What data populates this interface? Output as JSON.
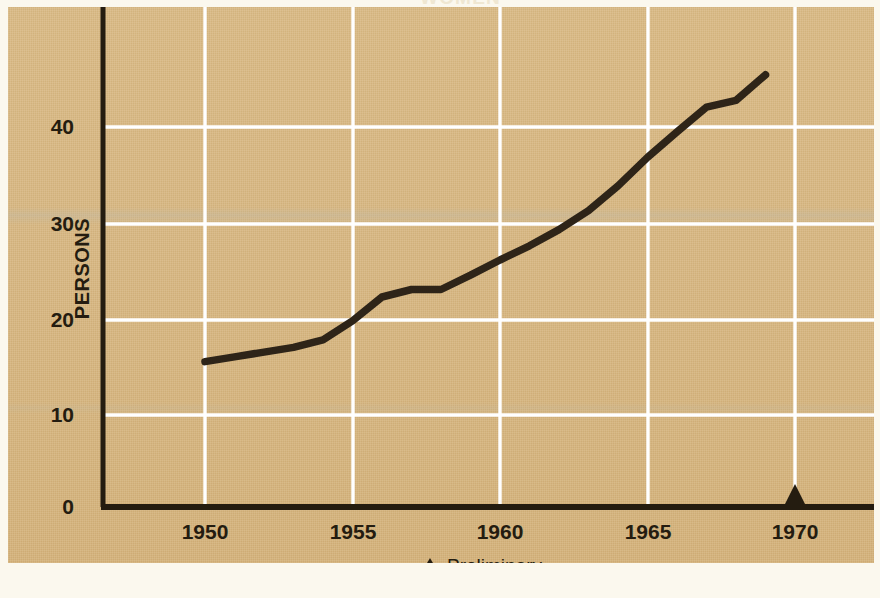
{
  "title": {
    "text": "WOMEN",
    "note": "title is cropped off the top edge; only the bottom sliver of the letters is visible"
  },
  "axes": {
    "y_label": "PERSONS",
    "y_ticks": [
      "0",
      "10",
      "20",
      "30",
      "40"
    ],
    "x_ticks": [
      "1950",
      "1955",
      "1960",
      "1965",
      "1970"
    ]
  },
  "legend": {
    "marker": "triangle-marker",
    "label": "Preliminary"
  },
  "colors": {
    "paper": "#d7b782",
    "ink": "#241c10",
    "gridline": "#ffffff",
    "margin": "#fbf8ee"
  },
  "chart_data": {
    "type": "line",
    "title": "WOMEN",
    "xlabel": "",
    "ylabel": "PERSONS",
    "xlim": [
      1949.2,
      1971.5
    ],
    "ylim": [
      0,
      47.5
    ],
    "grid": true,
    "grid_x": [
      1950,
      1955,
      1960,
      1965,
      1970
    ],
    "grid_y": [
      10,
      20,
      30,
      40
    ],
    "legend_position": "below-axis",
    "annotations": [
      {
        "kind": "triangle-marker",
        "x": 1970,
        "y": 0,
        "label": "Preliminary"
      }
    ],
    "series": [
      {
        "name": "Persons",
        "color": "#2e2418",
        "x": [
          1950,
          1951,
          1952,
          1953,
          1954,
          1955,
          1956,
          1957,
          1958,
          1959,
          1960,
          1961,
          1962,
          1963,
          1964,
          1965,
          1966,
          1967,
          1968,
          1969
        ],
        "values": [
          15.3,
          15.8,
          16.3,
          16.8,
          17.6,
          19.6,
          22.1,
          22.9,
          22.9,
          24.4,
          26.0,
          27.5,
          29.2,
          31.2,
          33.8,
          36.8,
          39.5,
          42.1,
          42.8,
          45.5
        ]
      }
    ]
  }
}
